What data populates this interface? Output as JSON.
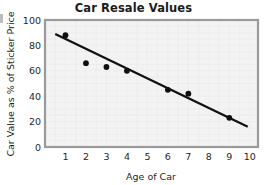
{
  "chart_data": {
    "type": "scatter",
    "title": "Car Resale Values",
    "xlabel": "Age of Car",
    "ylabel": "Car Value as % of Sticker Price",
    "xlim": [
      0,
      10.4
    ],
    "ylim": [
      0,
      100
    ],
    "grid": true,
    "legend": null,
    "x_ticks": [
      1,
      2,
      3,
      4,
      5,
      6,
      7,
      8,
      9,
      10
    ],
    "y_ticks": [
      0,
      20,
      40,
      60,
      80,
      100
    ],
    "points": [
      {
        "x": 1,
        "y": 88
      },
      {
        "x": 2,
        "y": 66
      },
      {
        "x": 3,
        "y": 63
      },
      {
        "x": 4,
        "y": 60
      },
      {
        "x": 6,
        "y": 45
      },
      {
        "x": 7,
        "y": 42
      },
      {
        "x": 9,
        "y": 23
      }
    ],
    "trend_line": {
      "x_start": 0.5,
      "y_start": 89,
      "x_end": 9.9,
      "y_end": 16
    },
    "colors": {
      "point": "#101010",
      "line": "#111111",
      "plot_background": "#f3f3f3",
      "plot_border": "#9a9a9a",
      "grid": "#e9e9e9",
      "text": "#1f1f1f",
      "title": "#1a1a1a"
    }
  }
}
